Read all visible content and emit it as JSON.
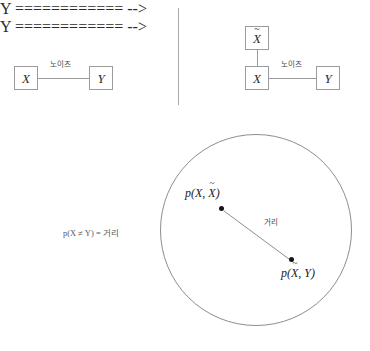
{
  "figure": {
    "title": "",
    "background_color": "#ffffff",
    "line_color": "#9b9b9b",
    "dot_color": "#141414",
    "text_color": "#2b2b2b"
  },
  "left_panel": {
    "nodes": [
      {
        "id": "x",
        "label": "X",
        "tilde": false
      },
      {
        "id": "y",
        "label": "Y",
        "tilde": false
      }
    ],
    "edge_label": "노이즈"
  },
  "right_panel": {
    "nodes": [
      {
        "id": "xtilde",
        "label": "X",
        "tilde": true
      },
      {
        "id": "x",
        "label": "X",
        "tilde": false
      },
      {
        "id": "y",
        "label": "Y",
        "tilde": false
      }
    ],
    "edge_label": "노이즈"
  },
  "metric_space": {
    "equation": "p(X ≠ Y) = 거리",
    "distance_label": "거리",
    "points": [
      {
        "id": "p-x-xtilde",
        "prefix": "p(",
        "first": "X",
        "separator": ", ",
        "second": "X",
        "second_tilde": true,
        "suffix": ")"
      },
      {
        "id": "p-xtilde-y",
        "prefix": "p(",
        "first": "X",
        "first_tilde": true,
        "separator": ", ",
        "second": "Y",
        "suffix": ")"
      }
    ]
  }
}
